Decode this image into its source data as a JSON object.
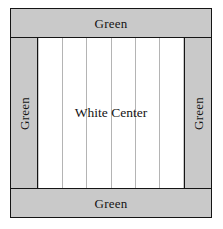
{
  "diagram": {
    "type": "quilt-panel-schematic",
    "colors": {
      "border_fill": "#c9c9c9",
      "center_fill": "#ffffff",
      "outline": "#151515",
      "strip_line": "#b4b4b4",
      "text": "#141414"
    },
    "borders": {
      "top": {
        "label": "Green",
        "orientation": "horizontal"
      },
      "bottom": {
        "label": "Green",
        "orientation": "horizontal"
      },
      "left": {
        "label": "Green",
        "orientation": "vertical-bottom-to-top"
      },
      "right": {
        "label": "Green",
        "orientation": "vertical-bottom-to-top"
      }
    },
    "center": {
      "label": "White Center",
      "strip_count": 6,
      "divider_count": 5
    }
  }
}
